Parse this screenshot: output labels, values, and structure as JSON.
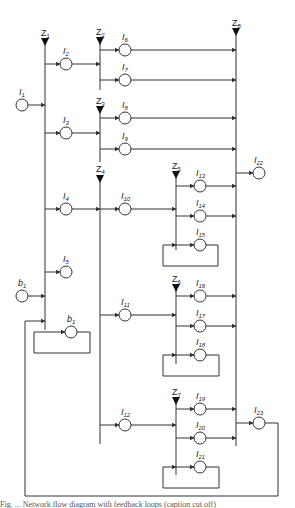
{
  "diagram": {
    "type": "network-flow-diagram",
    "buses": [
      {
        "id": "Z1",
        "label": "Z",
        "sub": "1",
        "x": 45,
        "y1": 42,
        "y2": 330
      },
      {
        "id": "Z2",
        "label": "Z",
        "sub": "2",
        "x": 100,
        "y1": 40,
        "y2": 90
      },
      {
        "id": "Z3",
        "label": "Z",
        "sub": "3",
        "x": 100,
        "y1": 109,
        "y2": 162
      },
      {
        "id": "Z4",
        "label": "Z",
        "sub": "4",
        "x": 100,
        "y1": 180,
        "y2": 444
      },
      {
        "id": "Z5",
        "label": "Z",
        "sub": "5",
        "x": 176,
        "y1": 172,
        "y2": 248
      },
      {
        "id": "Z6",
        "label": "Z",
        "sub": "6",
        "x": 176,
        "y1": 290,
        "y2": 362
      },
      {
        "id": "Z7",
        "label": "Z",
        "sub": "7",
        "x": 176,
        "y1": 405,
        "y2": 482
      },
      {
        "id": "Z8",
        "label": "Z",
        "sub": "8",
        "x": 236,
        "y1": 32,
        "y2": 446
      }
    ],
    "nodes": [
      {
        "id": "I1",
        "label": "I",
        "sub": "1",
        "x": 22,
        "y": 105
      },
      {
        "id": "I2",
        "label": "I",
        "sub": "2",
        "x": 66,
        "y": 64
      },
      {
        "id": "I3",
        "label": "I",
        "sub": "3",
        "x": 66,
        "y": 133
      },
      {
        "id": "I4",
        "label": "I",
        "sub": "4",
        "x": 66,
        "y": 209
      },
      {
        "id": "I5",
        "label": "I",
        "sub": "5",
        "x": 66,
        "y": 272
      },
      {
        "id": "b1_in",
        "label": "b",
        "sub": "1",
        "x": 22,
        "y": 296
      },
      {
        "id": "b1_loop",
        "label": "b",
        "sub": "1",
        "x": 71,
        "y": 332
      },
      {
        "id": "I6",
        "label": "I",
        "sub": "6",
        "x": 125,
        "y": 50
      },
      {
        "id": "I7",
        "label": "I",
        "sub": "7",
        "x": 125,
        "y": 80
      },
      {
        "id": "I8",
        "label": "I",
        "sub": "8",
        "x": 125,
        "y": 118
      },
      {
        "id": "I9",
        "label": "I",
        "sub": "9",
        "x": 125,
        "y": 149
      },
      {
        "id": "I10",
        "label": "I",
        "sub": "10",
        "x": 125,
        "y": 209
      },
      {
        "id": "I11",
        "label": "I",
        "sub": "11",
        "x": 125,
        "y": 315
      },
      {
        "id": "I12",
        "label": "I",
        "sub": "12",
        "x": 125,
        "y": 425
      },
      {
        "id": "I13",
        "label": "I",
        "sub": "13",
        "x": 200,
        "y": 186
      },
      {
        "id": "I14",
        "label": "I",
        "sub": "14",
        "x": 200,
        "y": 216
      },
      {
        "id": "I15",
        "label": "I",
        "sub": "15",
        "x": 200,
        "y": 245
      },
      {
        "id": "I16",
        "label": "I",
        "sub": "16",
        "x": 200,
        "y": 296
      },
      {
        "id": "I17",
        "label": "I",
        "sub": "17",
        "x": 200,
        "y": 326
      },
      {
        "id": "I18",
        "label": "I",
        "sub": "18",
        "x": 200,
        "y": 355
      },
      {
        "id": "I19",
        "label": "I",
        "sub": "19",
        "x": 200,
        "y": 409
      },
      {
        "id": "I20",
        "label": "I",
        "sub": "20",
        "x": 200,
        "y": 438
      },
      {
        "id": "I21",
        "label": "I",
        "sub": "21",
        "x": 200,
        "y": 467
      },
      {
        "id": "I22",
        "label": "I",
        "sub": "22",
        "x": 259,
        "y": 173
      },
      {
        "id": "I23",
        "label": "I",
        "sub": "23",
        "x": 259,
        "y": 423
      }
    ],
    "caption": "Fig. ... Network flow diagram with feedback loops (caption cut off)"
  }
}
